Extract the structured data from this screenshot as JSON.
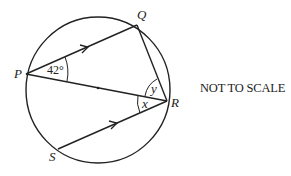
{
  "diagram": {
    "type": "circle-geometry",
    "points": {
      "P": {
        "label": "P",
        "x": 26,
        "y": 74
      },
      "Q": {
        "label": "Q",
        "x": 137,
        "y": 25
      },
      "R": {
        "label": "R",
        "x": 167,
        "y": 101
      },
      "S": {
        "label": "S",
        "x": 58,
        "y": 149
      }
    },
    "center": {
      "x": 98,
      "y": 88
    },
    "angles": {
      "QPR": "42°",
      "QRP": "y",
      "PRS": "x"
    },
    "parallel_lines": [
      "PQ",
      "SR"
    ],
    "note": "NOT TO SCALE"
  }
}
